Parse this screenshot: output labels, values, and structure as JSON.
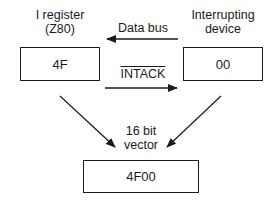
{
  "diagram": {
    "left_node": {
      "title_line1": "I register",
      "title_line2": "(Z80)",
      "value": "4F"
    },
    "right_node": {
      "title_line1": "Interrupting",
      "title_line2": "device",
      "value": "00"
    },
    "bottom_node": {
      "title_line1": "16 bit",
      "title_line2": "vector",
      "value": "4F00"
    },
    "edges": [
      {
        "from": "right_node",
        "to": "left_node",
        "label": "Data bus"
      },
      {
        "from": "left_node",
        "to": "right_node",
        "label": "INTACK",
        "label_overlined": true
      },
      {
        "from": "left_node",
        "to": "bottom_node",
        "label": ""
      },
      {
        "from": "right_node",
        "to": "bottom_node",
        "label": ""
      }
    ],
    "colors": {
      "stroke": "#1a1a1a",
      "background": "#ffffff"
    }
  }
}
